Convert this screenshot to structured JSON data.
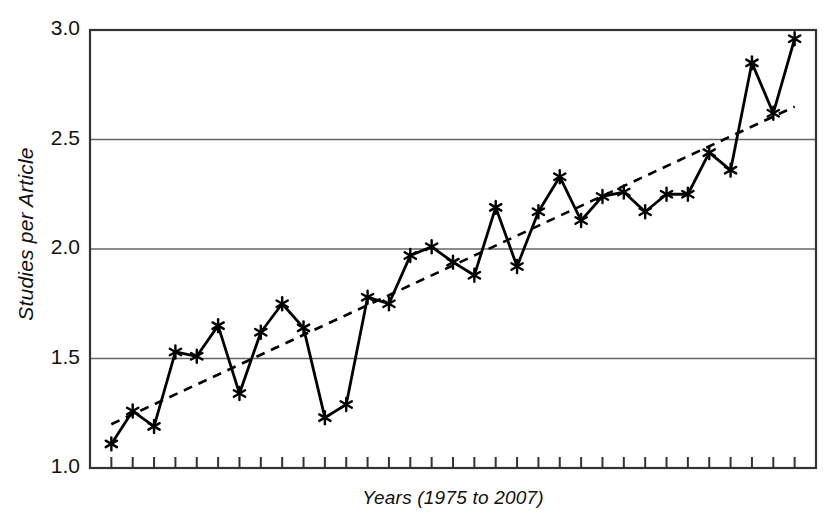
{
  "chart_data": {
    "type": "line",
    "title": "",
    "subtitle": "",
    "xlabel": "Years (1975 to 2007)",
    "ylabel": "Studies per Article",
    "ylim": [
      1.0,
      3.0
    ],
    "xlim": [
      1975,
      2007
    ],
    "ytick_labels": [
      "1.0",
      "1.5",
      "2.0",
      "2.5",
      "3.0"
    ],
    "ytick_values": [
      1.0,
      1.5,
      2.0,
      2.5,
      3.0
    ],
    "grid": "horizontal",
    "legend": "none",
    "x": [
      1975,
      1976,
      1977,
      1978,
      1979,
      1980,
      1981,
      1982,
      1983,
      1984,
      1985,
      1986,
      1987,
      1988,
      1989,
      1990,
      1991,
      1992,
      1993,
      1994,
      1995,
      1996,
      1997,
      1998,
      1999,
      2000,
      2001,
      2002,
      2003,
      2004,
      2005,
      2006,
      2007
    ],
    "series": [
      {
        "name": "Studies per Article",
        "marker": "asterisk",
        "linestyle": "solid",
        "color": "#000000",
        "values": [
          1.11,
          1.26,
          1.19,
          1.53,
          1.51,
          1.65,
          1.34,
          1.62,
          1.75,
          1.64,
          1.23,
          1.29,
          1.78,
          1.75,
          1.97,
          2.01,
          1.94,
          1.88,
          2.19,
          1.92,
          2.17,
          2.33,
          2.13,
          2.24,
          2.26,
          2.17,
          2.25,
          2.25,
          2.44,
          2.36,
          2.85,
          2.62,
          2.96
        ]
      },
      {
        "name": "Linear trend",
        "marker": "none",
        "linestyle": "dashed",
        "color": "#000000",
        "trend_start": 1.2,
        "trend_end": 2.65
      }
    ],
    "tick_count": 33,
    "axis_colors": {
      "frame": "#333333",
      "gridline": "#666666",
      "data": "#000000"
    }
  }
}
